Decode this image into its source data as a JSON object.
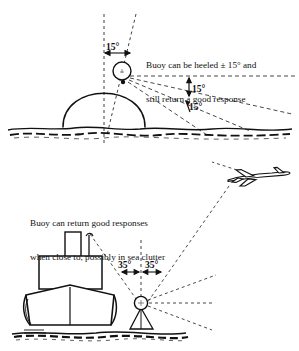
{
  "figure": {
    "background_color": "#ffffff",
    "ink_color": "#111111",
    "width": 299,
    "height": 351
  },
  "top_panel": {
    "caption_line1": "Buoy can be heeled ± 15° and",
    "caption_line2": "still return a good response",
    "heel_angle_label": "15°",
    "beam_label_upper": "15°",
    "beam_label_lower": "15°",
    "objects": {
      "buoy": "buoy-circle",
      "dome": "dome-hemisphere",
      "sea": "waterline",
      "vertical_reference": "vertical-dashed-axis",
      "heeled_axis": "tilted-dashed-axis",
      "rays": "radar-return-rays"
    }
  },
  "bottom_panel": {
    "caption_line1": "Buoy can return good responses",
    "caption_line2": "when close to, possibly in sea clutter",
    "angle_label_left": "35°",
    "angle_label_right": "35°",
    "objects": {
      "ship": "ship-bow-view",
      "funnel": "ship-funnel",
      "superstructure": "ship-superstructure",
      "hull": "ship-hull",
      "buoy": "buoy-circle",
      "buoy_base": "buoy-conical-base",
      "aircraft": "aircraft-silhouette",
      "sea": "waterline",
      "vertical_reference": "vertical-dashed-axis",
      "rays": "radar-return-rays"
    }
  }
}
